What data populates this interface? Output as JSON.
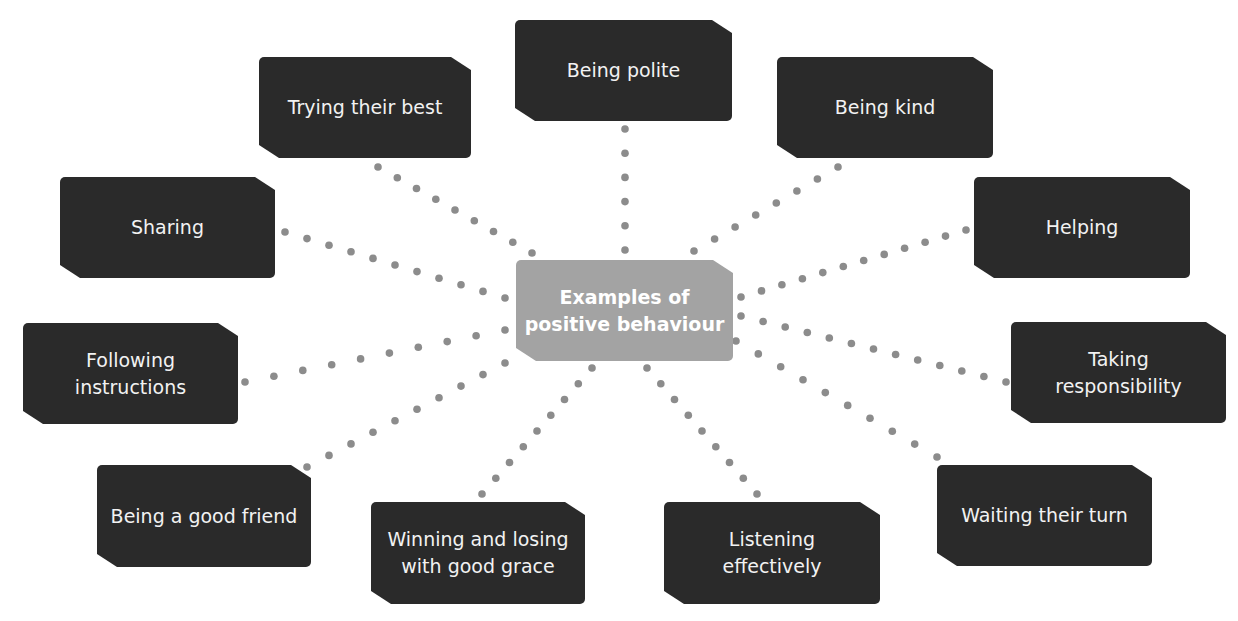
{
  "diagram": {
    "type": "mind-map",
    "center": {
      "label": "Examples of\npositive behaviour",
      "color": "#a3a3a3"
    },
    "node_color": "#2a2a2a",
    "connector_color": "#8c8c8c",
    "connector_style": "dotted",
    "nodes": [
      {
        "id": "being-polite",
        "label": "Being polite"
      },
      {
        "id": "being-kind",
        "label": "Being kind"
      },
      {
        "id": "helping",
        "label": "Helping"
      },
      {
        "id": "taking-responsibility",
        "label": "Taking\nresponsibility"
      },
      {
        "id": "waiting-their-turn",
        "label": "Waiting their turn"
      },
      {
        "id": "listening-effectively",
        "label": "Listening\neffectively"
      },
      {
        "id": "winning-and-losing",
        "label": "Winning and losing\nwith good grace"
      },
      {
        "id": "being-a-good-friend",
        "label": "Being a good friend"
      },
      {
        "id": "following-instructions",
        "label": "Following\ninstructions"
      },
      {
        "id": "sharing",
        "label": "Sharing"
      },
      {
        "id": "trying-their-best",
        "label": "Trying their best"
      }
    ]
  }
}
